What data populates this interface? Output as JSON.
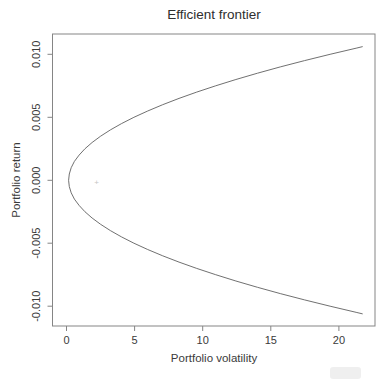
{
  "chart_data": {
    "type": "line",
    "title": "Efficient frontier",
    "xlabel": "Portfolio volatility",
    "ylabel": "Portfolio return",
    "xlim": [
      -1.03,
      22.65
    ],
    "ylim": [
      -0.01157,
      0.01161
    ],
    "x_ticks": [
      0,
      5,
      10,
      15,
      20
    ],
    "x_tick_labels": [
      "0",
      "5",
      "10",
      "15",
      "20"
    ],
    "y_ticks": [
      0.01,
      0.005,
      0.0,
      -0.005,
      -0.01
    ],
    "y_tick_labels": [
      "0.010",
      "0.005",
      "0.000",
      "-0.005",
      "-0.010"
    ],
    "grid": false,
    "legend_position": "none",
    "series": [
      {
        "name": "efficient-frontier",
        "color": "#606060",
        "points": [
          [
            21.72,
            0.0106
          ],
          [
            21.32,
            0.0105
          ],
          [
            19.35,
            0.01
          ],
          [
            17.48,
            0.0095
          ],
          [
            15.7,
            0.009
          ],
          [
            14.02,
            0.0085
          ],
          [
            12.44,
            0.008
          ],
          [
            10.95,
            0.0075
          ],
          [
            9.56,
            0.007
          ],
          [
            8.26,
            0.0065
          ],
          [
            7.06,
            0.006
          ],
          [
            5.96,
            0.0055
          ],
          [
            4.95,
            0.005
          ],
          [
            4.04,
            0.0045
          ],
          [
            3.22,
            0.004
          ],
          [
            2.5,
            0.0035
          ],
          [
            1.88,
            0.003
          ],
          [
            1.35,
            0.0025
          ],
          [
            0.92,
            0.002
          ],
          [
            0.58,
            0.0015
          ],
          [
            0.34,
            0.001
          ],
          [
            0.2,
            0.0005
          ],
          [
            0.15,
            0.0
          ],
          [
            0.2,
            -0.0005
          ],
          [
            0.34,
            -0.001
          ],
          [
            0.58,
            -0.0015
          ],
          [
            0.92,
            -0.002
          ],
          [
            1.35,
            -0.0025
          ],
          [
            1.88,
            -0.003
          ],
          [
            2.5,
            -0.0035
          ],
          [
            3.22,
            -0.004
          ],
          [
            4.04,
            -0.0045
          ],
          [
            4.95,
            -0.005
          ],
          [
            5.96,
            -0.0055
          ],
          [
            7.06,
            -0.006
          ],
          [
            8.26,
            -0.0065
          ],
          [
            9.56,
            -0.007
          ],
          [
            10.95,
            -0.0075
          ],
          [
            12.44,
            -0.008
          ],
          [
            14.02,
            -0.0085
          ],
          [
            15.7,
            -0.009
          ],
          [
            17.48,
            -0.0095
          ],
          [
            19.35,
            -0.01
          ],
          [
            21.32,
            -0.0105
          ],
          [
            21.72,
            -0.0106
          ]
        ]
      }
    ],
    "marker": {
      "x": 2.2,
      "y": -0.0002,
      "symbol": "+",
      "color": "#c4c4c4"
    }
  },
  "colors": {
    "background": "#ffffff",
    "box_stroke": "#858585",
    "tick_stroke": "#858585",
    "text": "#3a3a3a",
    "title_text": "#2e2e2e"
  }
}
